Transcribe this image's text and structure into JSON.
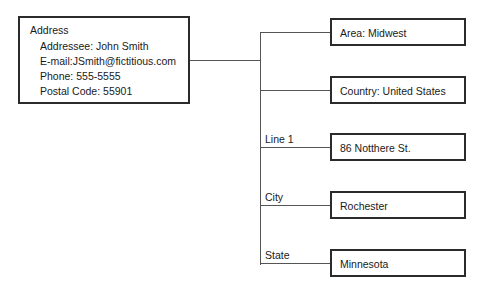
{
  "diagram": {
    "type": "entity-relationship-tree",
    "root": {
      "title": "Address",
      "fields": [
        "Addressee: John Smith",
        "E-mail:JSmith@fictitious.com",
        "Phone: 555-5555",
        "Postal Code: 55901"
      ]
    },
    "branches": [
      {
        "edge_label": "",
        "value": "Area: Midwest"
      },
      {
        "edge_label": "",
        "value": "Country: United States"
      },
      {
        "edge_label": "Line 1",
        "value": "86 Notthere St."
      },
      {
        "edge_label": "City",
        "value": "Rochester"
      },
      {
        "edge_label": "State",
        "value": "Minnesota"
      }
    ],
    "colors": {
      "background": "#ffffff",
      "box_border": "#2b2b2b",
      "connector": "#555555",
      "text": "#1a1a1a"
    }
  }
}
